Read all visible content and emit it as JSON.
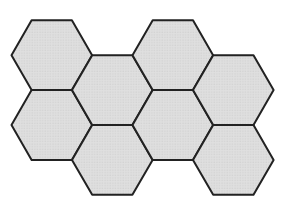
{
  "figure": {
    "canvas": {
      "width": 287,
      "height": 217
    },
    "hex_radius": 40.3,
    "stroke_color": "#222222",
    "stroke_width": 2,
    "fill_base": "#dfdfdf",
    "fill_dot": "#c9c9c9",
    "background": "#ffffff",
    "hexagons": [
      {
        "id": "top-left",
        "cx": 51.8,
        "cy": 55.2
      },
      {
        "id": "bottom-left",
        "cx": 51.8,
        "cy": 125.0
      },
      {
        "id": "middle-upper",
        "cx": 112.3,
        "cy": 90.1
      },
      {
        "id": "middle-lower",
        "cx": 112.3,
        "cy": 159.9
      },
      {
        "id": "top-center",
        "cx": 172.8,
        "cy": 55.2
      },
      {
        "id": "center-right",
        "cx": 172.8,
        "cy": 125.0
      },
      {
        "id": "right-upper",
        "cx": 233.3,
        "cy": 90.1
      },
      {
        "id": "right-lower",
        "cx": 233.3,
        "cy": 159.9
      }
    ]
  }
}
